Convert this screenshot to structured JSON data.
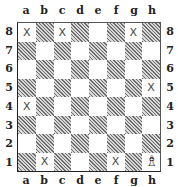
{
  "files": [
    "a",
    "b",
    "c",
    "d",
    "e",
    "f",
    "g",
    "h"
  ],
  "ranks": [
    "8",
    "7",
    "6",
    "5",
    "4",
    "3",
    "2",
    "1"
  ],
  "colors": {
    "light": "#ffffff",
    "dark": "#9a9a9a",
    "border": "#222222"
  },
  "marker_symbol": "X",
  "marked_squares": [
    "a8",
    "c8",
    "g8",
    "h5",
    "a4",
    "b1",
    "f1"
  ],
  "pieces": [
    {
      "square": "h1",
      "piece": "white-bishop",
      "glyph": "♗"
    }
  ]
}
